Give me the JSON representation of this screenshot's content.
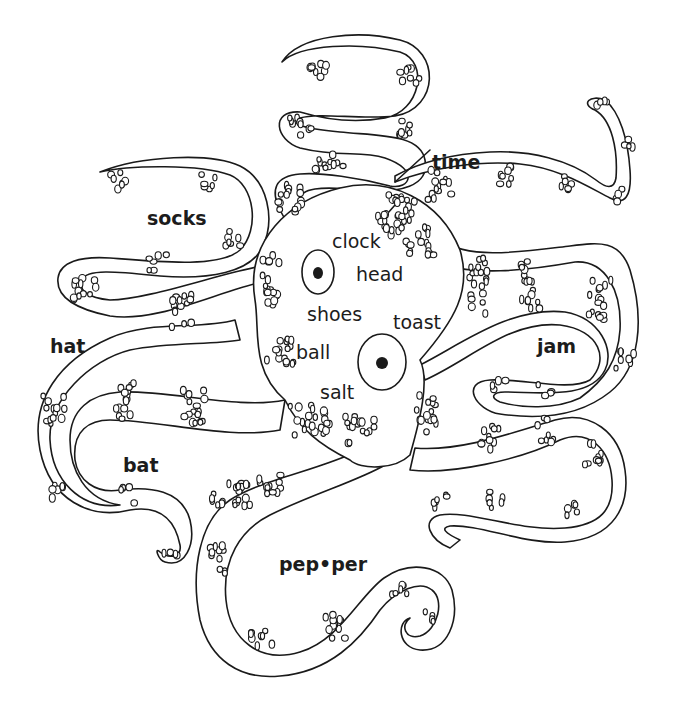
{
  "illustration": {
    "subject": "octopus",
    "style": "black line drawing with banded sucker patches",
    "colors": {
      "ink": "#1a1a1a",
      "paper": "#ffffff",
      "text": "#1c1c1c"
    }
  },
  "outer_labels": [
    {
      "id": "time",
      "text": "time"
    },
    {
      "id": "socks",
      "text": "socks"
    },
    {
      "id": "hat",
      "text": "hat"
    },
    {
      "id": "jam",
      "text": "jam"
    },
    {
      "id": "bat",
      "text": "bat"
    },
    {
      "id": "pepper",
      "text": "pep•per"
    }
  ],
  "inner_labels": [
    {
      "id": "clock",
      "text": "clock"
    },
    {
      "id": "head",
      "text": "head"
    },
    {
      "id": "shoes",
      "text": "shoes"
    },
    {
      "id": "toast",
      "text": "toast"
    },
    {
      "id": "ball",
      "text": "ball"
    },
    {
      "id": "salt",
      "text": "salt"
    }
  ]
}
